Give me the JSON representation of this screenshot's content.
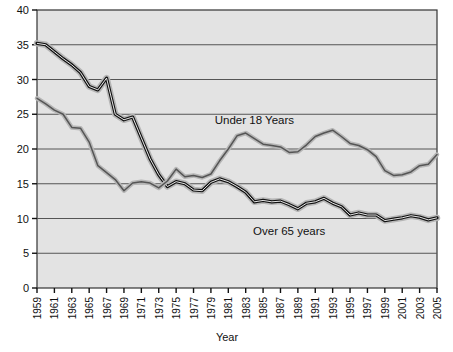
{
  "chart_data": {
    "type": "line",
    "title": "",
    "xlabel": "Year",
    "ylabel": "",
    "xlim": [
      1959,
      2005
    ],
    "ylim": [
      0,
      40
    ],
    "ytick_step": 5,
    "grid": true,
    "legend": "inline-annotations",
    "yticks": [
      "0",
      "5",
      "10",
      "15",
      "20",
      "25",
      "30",
      "35",
      "40"
    ],
    "x": [
      1959,
      1960,
      1961,
      1962,
      1963,
      1964,
      1965,
      1966,
      1967,
      1968,
      1969,
      1970,
      1971,
      1972,
      1973,
      1974,
      1975,
      1976,
      1977,
      1978,
      1979,
      1980,
      1981,
      1982,
      1983,
      1984,
      1985,
      1986,
      1987,
      1988,
      1989,
      1990,
      1991,
      1992,
      1993,
      1994,
      1995,
      1996,
      1997,
      1998,
      1999,
      2000,
      2001,
      2002,
      2003,
      2004,
      2005
    ],
    "xticks": [
      "1959",
      "1961",
      "1963",
      "1965",
      "1967",
      "1969",
      "1971",
      "1973",
      "1975",
      "1977",
      "1979",
      "1981",
      "1983",
      "1985",
      "1987",
      "1989",
      "1991",
      "1993",
      "1995",
      "1997",
      "1999",
      "2001",
      "2003",
      "2005"
    ],
    "series": [
      {
        "name": "Over 65 years",
        "color": "#111111",
        "label_x": 1988,
        "label_y": 7.6,
        "values": [
          35.2,
          35.0,
          34.0,
          33.0,
          32.1,
          31.0,
          29.0,
          28.5,
          30.2,
          25.0,
          24.2,
          24.6,
          21.6,
          18.6,
          16.3,
          14.6,
          15.3,
          15.0,
          14.1,
          14.0,
          15.2,
          15.7,
          15.3,
          14.6,
          13.8,
          12.4,
          12.6,
          12.4,
          12.5,
          12.0,
          11.4,
          12.2,
          12.4,
          12.9,
          12.2,
          11.7,
          10.5,
          10.8,
          10.5,
          10.5,
          9.7,
          9.9,
          10.1,
          10.4,
          10.2,
          9.8,
          10.1
        ]
      },
      {
        "name": "Under 18 Years",
        "color": "#555555",
        "label_x": 1984,
        "label_y": 23.6,
        "values": [
          27.3,
          26.5,
          25.6,
          25.0,
          23.1,
          23.0,
          21.0,
          17.6,
          16.6,
          15.6,
          14.0,
          15.1,
          15.3,
          15.1,
          14.4,
          15.4,
          17.1,
          16.0,
          16.2,
          15.9,
          16.4,
          18.3,
          20.0,
          21.9,
          22.3,
          21.5,
          20.7,
          20.5,
          20.3,
          19.5,
          19.6,
          20.6,
          21.8,
          22.3,
          22.7,
          21.8,
          20.8,
          20.5,
          19.9,
          18.9,
          16.9,
          16.2,
          16.3,
          16.7,
          17.6,
          17.8,
          19.2
        ]
      }
    ]
  }
}
